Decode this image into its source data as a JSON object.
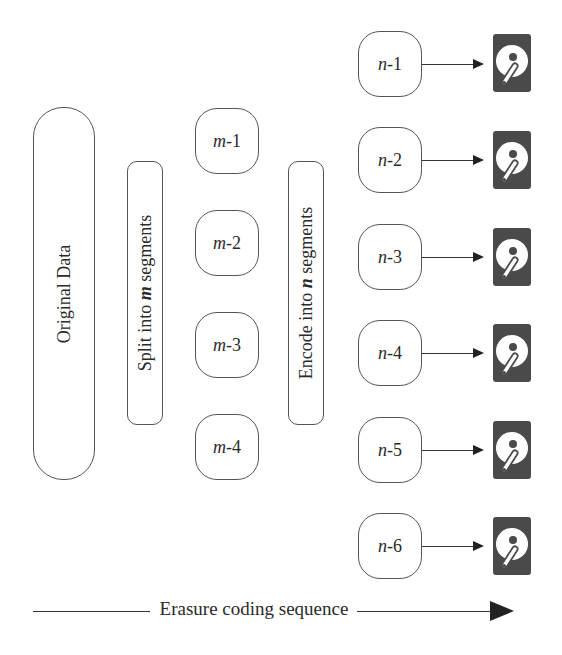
{
  "diagram": {
    "original": {
      "label": "Original Data"
    },
    "split": {
      "prefix": "Split into ",
      "var": "m",
      "suffix": " segments"
    },
    "encode": {
      "prefix": "Encode into ",
      "var": "n",
      "suffix": " segments"
    },
    "m_segments": [
      {
        "var": "m",
        "suffix": "-1"
      },
      {
        "var": "m",
        "suffix": "-2"
      },
      {
        "var": "m",
        "suffix": "-3"
      },
      {
        "var": "m",
        "suffix": "-4"
      }
    ],
    "n_segments": [
      {
        "var": "n",
        "suffix": "-1",
        "icon": "hard-drive-icon"
      },
      {
        "var": "n",
        "suffix": "-2",
        "icon": "hard-drive-icon"
      },
      {
        "var": "n",
        "suffix": "-3",
        "icon": "hard-drive-icon"
      },
      {
        "var": "n",
        "suffix": "-4",
        "icon": "hard-drive-icon"
      },
      {
        "var": "n",
        "suffix": "-5",
        "icon": "hard-drive-icon"
      },
      {
        "var": "n",
        "suffix": "-6",
        "icon": "hard-drive-icon"
      }
    ],
    "sequence": {
      "label": "Erasure coding sequence"
    },
    "colors": {
      "stroke": "#555555",
      "drive_body": "#4a4a4a",
      "text": "#2a2a2a"
    }
  }
}
